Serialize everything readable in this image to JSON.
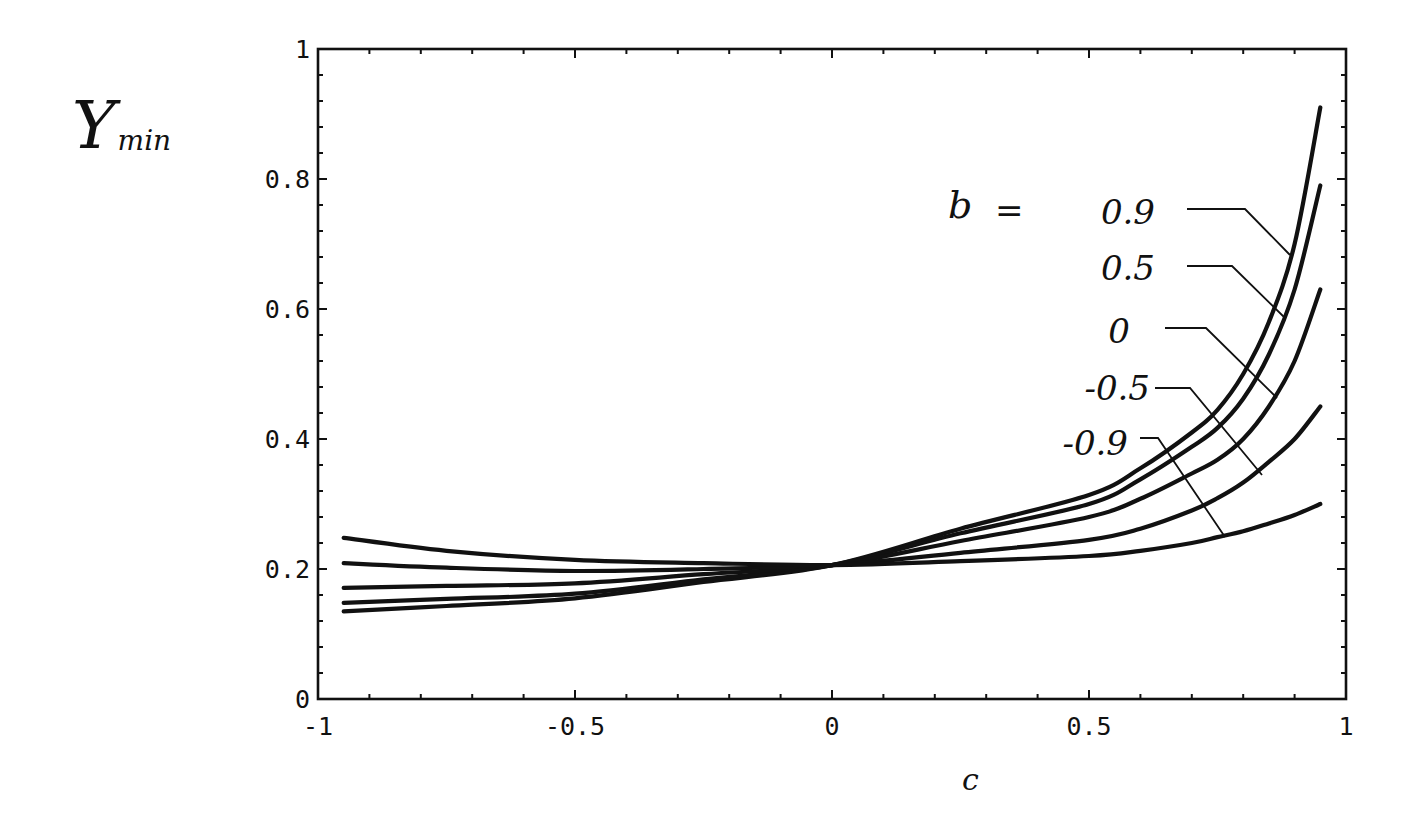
{
  "chart_data": {
    "type": "line",
    "title": "",
    "xlabel": "c",
    "ylabel": "Y_min",
    "ylabel_main": "Y",
    "ylabel_sub": "min",
    "xlim": [
      -1,
      1
    ],
    "ylim": [
      0,
      1
    ],
    "grid": false,
    "legend_position": "inline-right",
    "legend_title": "b =",
    "x_ticks": [
      -1,
      -0.5,
      0,
      0.5,
      1
    ],
    "x_tick_labels": [
      "-1",
      "-0.5",
      "0",
      "0.5",
      "1"
    ],
    "y_ticks": [
      0,
      0.2,
      0.4,
      0.6,
      0.8,
      1
    ],
    "y_tick_labels": [
      "0",
      "0.2",
      "0.4",
      "0.6",
      "0.8",
      "1"
    ],
    "x": [
      -0.95,
      -0.75,
      -0.5,
      -0.25,
      0,
      0.25,
      0.5,
      0.6,
      0.7,
      0.75,
      0.8,
      0.85,
      0.9,
      0.95
    ],
    "series": [
      {
        "name": "b = 0.9",
        "label": "0.9",
        "values": [
          0.135,
          0.143,
          0.155,
          0.18,
          0.206,
          0.262,
          0.314,
          0.355,
          0.41,
          0.445,
          0.5,
          0.58,
          0.7,
          0.91
        ]
      },
      {
        "name": "b = 0.5",
        "label": "0.5",
        "values": [
          0.148,
          0.154,
          0.162,
          0.184,
          0.206,
          0.255,
          0.3,
          0.338,
          0.388,
          0.417,
          0.462,
          0.53,
          0.63,
          0.79
        ]
      },
      {
        "name": "b = 0",
        "label": "0",
        "values": [
          0.171,
          0.174,
          0.178,
          0.192,
          0.206,
          0.243,
          0.28,
          0.308,
          0.347,
          0.368,
          0.4,
          0.45,
          0.52,
          0.63
        ]
      },
      {
        "name": "b = -0.5",
        "label": "-0.5",
        "values": [
          0.209,
          0.202,
          0.197,
          0.2,
          0.206,
          0.225,
          0.245,
          0.262,
          0.29,
          0.309,
          0.333,
          0.365,
          0.4,
          0.45
        ]
      },
      {
        "name": "b = -0.9",
        "label": "-0.9",
        "values": [
          0.248,
          0.228,
          0.214,
          0.209,
          0.206,
          0.212,
          0.22,
          0.228,
          0.24,
          0.249,
          0.258,
          0.27,
          0.283,
          0.3
        ]
      }
    ],
    "annotations": [
      {
        "text": "b =",
        "x_px": 950,
        "y_px": 218
      },
      {
        "text": "0.9",
        "series": 0
      },
      {
        "text": "0.5",
        "series": 1
      },
      {
        "text": "0",
        "series": 2
      },
      {
        "text": "-0.5",
        "series": 3
      },
      {
        "text": "-0.9",
        "series": 4
      }
    ]
  },
  "layout": {
    "plot_left": 318,
    "plot_right": 1346,
    "plot_top": 49,
    "plot_bottom": 699,
    "line_color": "#111111",
    "background": "#ffffff"
  }
}
